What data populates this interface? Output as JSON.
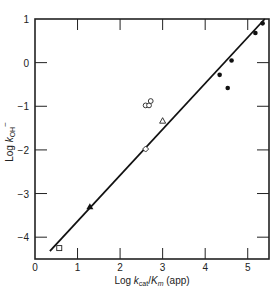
{
  "chart_data": {
    "type": "scatter",
    "title": "",
    "xlabel": "Log k_cat/K_m (app)",
    "ylabel": "Log k_OH−",
    "xlim": [
      0,
      5.5
    ],
    "ylim": [
      -4.5,
      1
    ],
    "x_ticks": [
      0,
      1,
      2,
      3,
      4,
      5
    ],
    "y_ticks": [
      1,
      0,
      -1,
      -2,
      -3,
      -4
    ],
    "grid": false,
    "legend": null,
    "series": [
      {
        "name": "filled-circles",
        "marker": "filled-circle",
        "points": [
          [
            4.34,
            -0.28
          ],
          [
            4.53,
            -0.58
          ],
          [
            4.62,
            0.05
          ],
          [
            5.18,
            0.68
          ],
          [
            5.35,
            0.9
          ]
        ]
      },
      {
        "name": "open-circles",
        "marker": "open-circle",
        "points": [
          [
            2.6,
            -0.98
          ],
          [
            2.68,
            -0.98
          ],
          [
            2.72,
            -0.88
          ]
        ]
      },
      {
        "name": "open-triangle",
        "marker": "open-triangle",
        "points": [
          [
            3.0,
            -1.33
          ]
        ]
      },
      {
        "name": "open-diamond",
        "marker": "open-diamond",
        "points": [
          [
            2.6,
            -1.98
          ]
        ]
      },
      {
        "name": "filled-triangle",
        "marker": "filled-triangle",
        "points": [
          [
            1.29,
            -3.3
          ]
        ]
      },
      {
        "name": "open-square",
        "marker": "open-square",
        "points": [
          [
            0.57,
            -4.25
          ]
        ]
      }
    ],
    "fit_line": {
      "x": [
        0.35,
        5.4
      ],
      "y": [
        -4.32,
        1.0
      ]
    }
  },
  "labels": {
    "x_axis": {
      "prefix": "Log ",
      "k": "k",
      "cat_sub": "cat",
      "slash": "/",
      "K": "K",
      "m_sub": "m",
      "suffix": " (app)"
    },
    "y_axis": {
      "prefix": "Log ",
      "k": "k",
      "sub": "OH",
      "sup": "−"
    }
  }
}
